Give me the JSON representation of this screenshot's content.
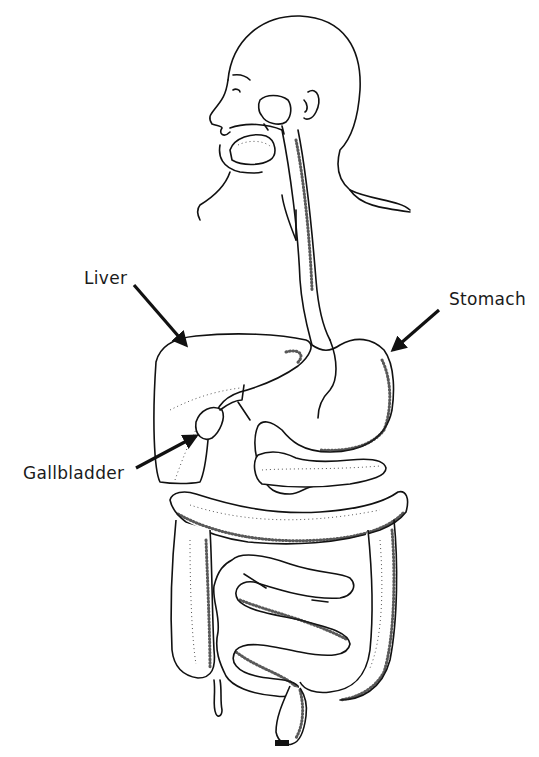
{
  "diagram": {
    "labels": {
      "liver": "Liver",
      "stomach": "Stomach",
      "gallbladder": "Gallbladder"
    },
    "colors": {
      "line": "#111111",
      "background": "#ffffff"
    }
  }
}
